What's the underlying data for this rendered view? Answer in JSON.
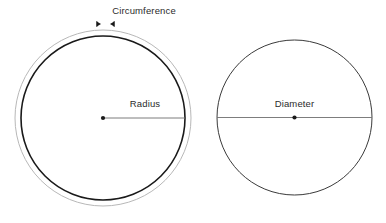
{
  "canvas": {
    "width": 386,
    "height": 223,
    "background_color": "#ffffff"
  },
  "figures": {
    "left": {
      "name": "circle-with-radius-and-circumference",
      "circumference": {
        "label": "Circumference",
        "label_x": 144,
        "label_y": 14,
        "color": "#b8b8b8",
        "center_x": 103,
        "center_y": 118,
        "radius": 88,
        "stroke_width": 1
      },
      "outline": {
        "color": "#1a1a1a",
        "center_x": 103,
        "center_y": 118,
        "radius": 82,
        "stroke_width": 1.6
      },
      "radius_line": {
        "label": "Radius",
        "label_x": 145,
        "label_y": 107,
        "color": "#6e6e6e",
        "stroke_width": 0.9,
        "from_x": 103,
        "from_y": 118,
        "to_x": 185,
        "to_y": 118
      },
      "center_dot": {
        "x": 103,
        "y": 118,
        "r": 2.1,
        "color": "#1a1a1a"
      },
      "arc_markers": {
        "color": "#1a1a1a",
        "left_arrow_x": 101,
        "right_arrow_x": 110,
        "y": 24
      }
    },
    "right": {
      "name": "circle-with-diameter",
      "outline": {
        "color": "#3a3a3a",
        "center_x": 294.5,
        "center_y": 117.5,
        "radius": 77.5,
        "stroke_width": 1
      },
      "diameter_line": {
        "label": "Diameter",
        "label_x": 294.5,
        "label_y": 107,
        "color": "#6e6e6e",
        "stroke_width": 0.9,
        "from_x": 217,
        "from_y": 117.5,
        "to_x": 372,
        "to_y": 117.5
      },
      "center_dot": {
        "x": 294.5,
        "y": 117.5,
        "r": 2.1,
        "color": "#1a1a1a"
      }
    }
  }
}
